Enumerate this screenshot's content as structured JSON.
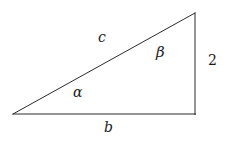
{
  "figure": {
    "name": "right-triangle-diagram",
    "background_color": "#ffffff",
    "stroke_color": "#2b2b2b",
    "stroke_width": 1,
    "width": 234,
    "height": 144
  },
  "geometry": {
    "vertices": {
      "left": {
        "x": 13,
        "y": 114
      },
      "top_right": {
        "x": 195,
        "y": 13
      },
      "bottom_right": {
        "x": 195,
        "y": 114
      }
    },
    "sides": [
      {
        "name": "hypotenuse",
        "from": "left",
        "to": "top_right",
        "label": "c"
      },
      {
        "name": "base",
        "from": "left",
        "to": "bottom_right",
        "label": "b"
      },
      {
        "name": "vertical-leg",
        "from": "bottom_right",
        "to": "top_right",
        "label": "2"
      }
    ]
  },
  "labels": {
    "hypotenuse": "c",
    "base": "b",
    "vertical_side": "2",
    "angle_left": "α",
    "angle_top_right": "β"
  }
}
